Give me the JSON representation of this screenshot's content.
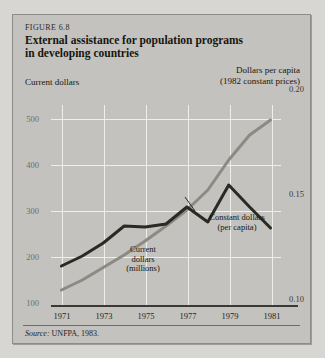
{
  "figure": {
    "number": "FIGURE 6.8",
    "title_line1": "External assistance for population programs",
    "title_line2": "in developing countries",
    "left_axis_title": "Current dollars",
    "right_axis_title_line1": "Dollars per capita",
    "right_axis_title_line2": "(1982 constant prices)",
    "source_label": "Source:",
    "source_text": " UNFPA, 1983."
  },
  "annotations": {
    "current_dollars_line1": "Current",
    "current_dollars_line2": "dollars",
    "current_dollars_line3": "(millions)",
    "constant_dollars_line1": "Constant dollars",
    "constant_dollars_line2": "(per capita)"
  },
  "colors": {
    "panel": "#c3c2be",
    "page": "#d8d6d2",
    "gridline": "#eeeeea",
    "constant_series": "#2a2924",
    "current_series": "#8b8a85",
    "axis": "#3a3935"
  },
  "chart_data": {
    "type": "line",
    "title": "External assistance for population programs in developing countries",
    "xlabel": "",
    "ylabel": "Current dollars",
    "y2label": "Dollars per capita (1982 constant prices)",
    "grid": true,
    "legend": "annotations-inline",
    "x": [
      1971,
      1972,
      1973,
      1974,
      1975,
      1976,
      1977,
      1978,
      1979,
      1980,
      1981
    ],
    "xlim": [
      1970.5,
      1981.5
    ],
    "xticks": [
      1971,
      1973,
      1975,
      1977,
      1979,
      1981
    ],
    "xticklabels": [
      "1971",
      "1973",
      "1975",
      "1977",
      "1979",
      "1981"
    ],
    "ylim": [
      100,
      500
    ],
    "yticks": [
      100,
      200,
      300,
      400,
      500
    ],
    "yticklabels": [
      "100",
      "200",
      "300",
      "400",
      "500"
    ],
    "y2lim": [
      0.1,
      0.2
    ],
    "y2ticks": [
      0.1,
      0.15,
      0.2
    ],
    "y2ticklabels": [
      "0.10",
      "0.15",
      "0.20"
    ],
    "series": [
      {
        "name": "Current dollars (millions)",
        "axis": "left",
        "color": "#8b8a85",
        "values": [
          130,
          150,
          175,
          200,
          228,
          258,
          290,
          330,
          390,
          440,
          470
        ]
      },
      {
        "name": "Constant dollars (per capita)",
        "axis": "right",
        "color": "#2a2924",
        "values": [
          0.1195,
          0.1245,
          0.131,
          0.1395,
          0.139,
          0.1405,
          0.149,
          0.1415,
          0.16,
          0.149,
          0.1385
        ]
      }
    ]
  }
}
